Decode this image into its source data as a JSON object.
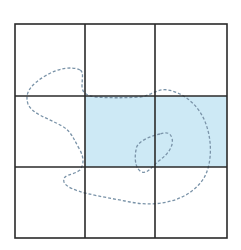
{
  "diagram": {
    "type": "grid-overlay",
    "grid": {
      "rows": 3,
      "cols": 3,
      "x_lines": [
        15,
        85,
        155,
        227
      ],
      "y_lines": [
        24,
        96,
        167,
        238
      ],
      "line_color": "#2a2a2a"
    },
    "shaded_cells": [
      {
        "row": 1,
        "col": 1
      },
      {
        "row": 1,
        "col": 2
      }
    ],
    "colors": {
      "shade": "#cde9f5",
      "dashed_outline": "#7a93a8",
      "background": "#ffffff"
    }
  }
}
